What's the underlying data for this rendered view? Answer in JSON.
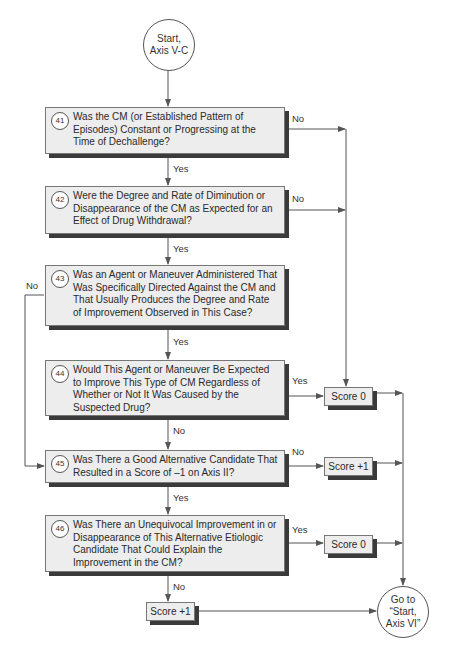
{
  "start": {
    "label_line1": "Start,",
    "label_line2": "Axis V-C"
  },
  "end": {
    "label_line1": "Go to",
    "label_line2": "“Start,",
    "label_line3": "Axis VI”"
  },
  "questions": [
    {
      "number": "41",
      "text": "Was the CM (or Established Pattern of Episodes) Constant or Progressing at the Time of Dechallenge?"
    },
    {
      "number": "42",
      "text": "Were the Degree and Rate of Diminution or Disappearance of the CM as Expected for an Effect of Drug Withdrawal?"
    },
    {
      "number": "43",
      "text": "Was an Agent or Maneuver Administered That Was Specifically Directed Against the CM and That Usually Produces the Degree and Rate of Improvement Observed in This Case?"
    },
    {
      "number": "44",
      "text": "Would This Agent or Maneuver Be Expected to Improve This Type of CM Regardless of Whether or Not It Was Caused by the Suspected Drug?"
    },
    {
      "number": "45",
      "text": "Was There a Good Alternative Candidate That Resulted in a Score of –1 on Axis II?"
    },
    {
      "number": "46",
      "text": "Was There an Unequivocal Improvement in or Disappearance of This Alternative Etiologic Candidate That Could Explain the Improvement in the CM?"
    }
  ],
  "scores": {
    "score_44_yes": "Score 0",
    "score_45_no": "Score +1",
    "score_46_yes": "Score 0",
    "score_46_no": "Score +1"
  },
  "edge_labels": {
    "q41_no": "No",
    "q41_yes": "Yes",
    "q42_no": "No",
    "q42_yes": "Yes",
    "q43_no": "No",
    "q43_yes": "Yes",
    "q44_yes": "Yes",
    "q44_no": "No",
    "q45_no": "No",
    "q45_yes": "Yes",
    "q46_yes": "Yes",
    "q46_no": "No"
  }
}
